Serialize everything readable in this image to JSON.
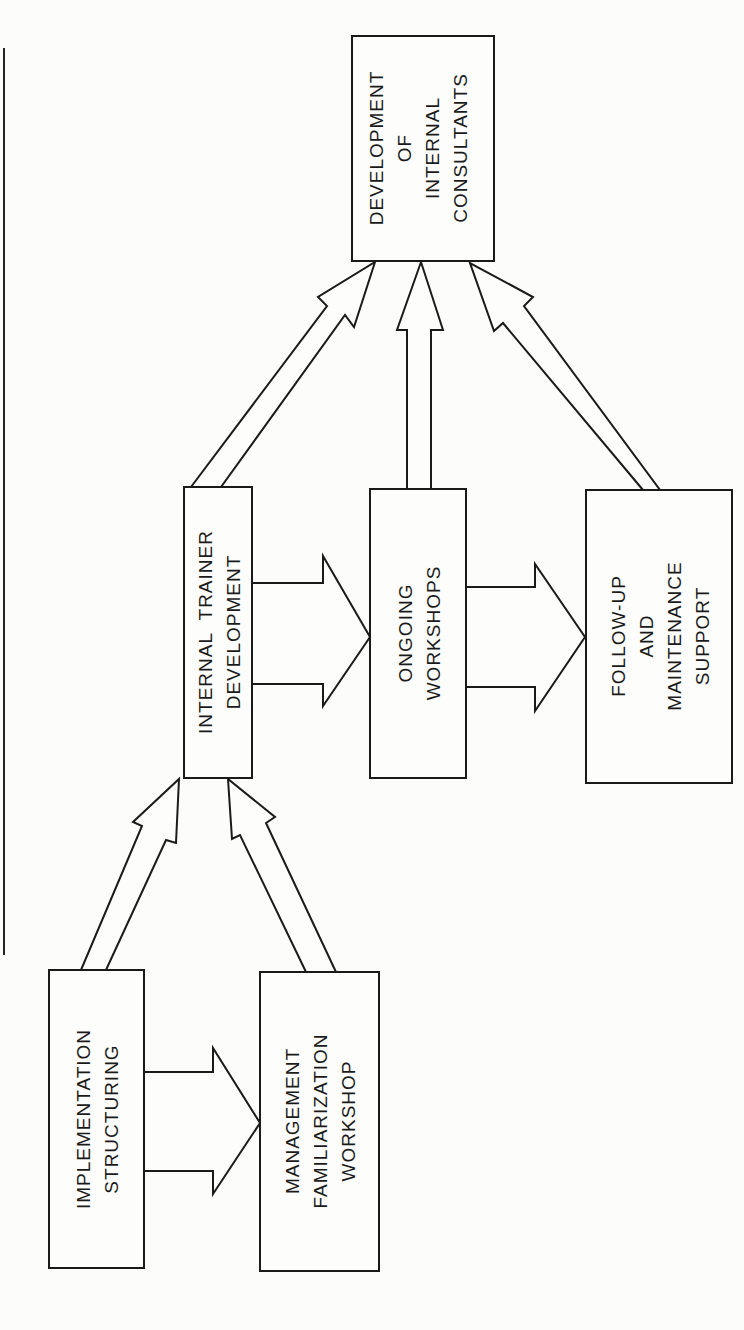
{
  "diagram": {
    "orientation": "rotated-90-ccw",
    "nodes": [
      {
        "id": "development",
        "lines": [
          "DEVELOPMENT",
          "OF",
          "INTERNAL",
          "CONSULTANTS"
        ]
      },
      {
        "id": "internal_trainer",
        "lines": [
          "INTERNAL  TRAINER",
          "DEVELOPMENT"
        ]
      },
      {
        "id": "ongoing",
        "lines": [
          "ONGOING",
          "WORKSHOPS"
        ]
      },
      {
        "id": "followup",
        "lines": [
          "FOLLOW-UP",
          "AND",
          "MAINTENANCE",
          "SUPPORT"
        ]
      },
      {
        "id": "implementation",
        "lines": [
          "IMPLEMENTATION",
          "STRUCTURING"
        ]
      },
      {
        "id": "management",
        "lines": [
          "MANAGEMENT",
          "FAMILIARIZATION",
          "WORKSHOP"
        ]
      }
    ],
    "edges": [
      {
        "from": "implementation",
        "to": "internal_trainer"
      },
      {
        "from": "management",
        "to": "internal_trainer"
      },
      {
        "from": "implementation",
        "to": "management"
      },
      {
        "from": "internal_trainer",
        "to": "ongoing"
      },
      {
        "from": "ongoing",
        "to": "followup"
      },
      {
        "from": "internal_trainer",
        "to": "development"
      },
      {
        "from": "ongoing",
        "to": "development"
      },
      {
        "from": "followup",
        "to": "development"
      }
    ]
  },
  "colors": {
    "stroke": "#1a1a1a",
    "background": "#fcfcfa"
  }
}
